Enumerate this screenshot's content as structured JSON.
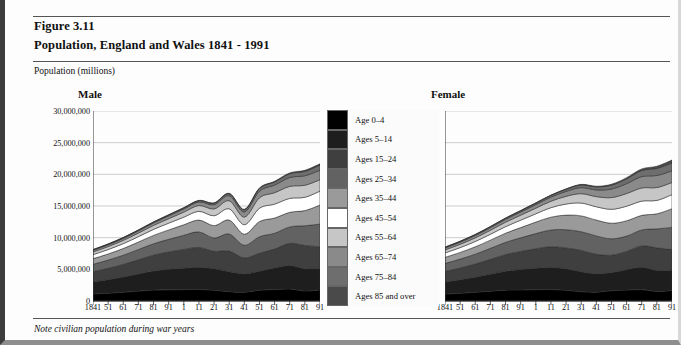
{
  "figure": {
    "number": "Figure 3.11",
    "title": "Population, England and Wales 1841 - 1991",
    "axis_unit": "Population (millions)",
    "note": "Note civilian population during war years"
  },
  "panels": [
    {
      "label": "Male"
    },
    {
      "label": "Female"
    }
  ],
  "legend": {
    "items": [
      {
        "label": "Age 0–4",
        "color": "#000000"
      },
      {
        "label": "Ages 5–14",
        "color": "#1e1e1e"
      },
      {
        "label": "Ages 15–24",
        "color": "#3f3f3f"
      },
      {
        "label": "Ages 25–34",
        "color": "#626262"
      },
      {
        "label": "Ages 35–44",
        "color": "#9a9a9a"
      },
      {
        "label": "Ages 45–54",
        "color": "#ffffff"
      },
      {
        "label": "Ages 55–64",
        "color": "#c6c6c6"
      },
      {
        "label": "Ages 65–74",
        "color": "#8a8a8a"
      },
      {
        "label": "Ages 75–84",
        "color": "#6e6e6e"
      },
      {
        "label": "Ages 85 and over",
        "color": "#4a4a4a"
      }
    ]
  },
  "chart_data": {
    "type": "area",
    "title": "Population, England and Wales 1841 - 1991",
    "subtitle": "Figure 3.11",
    "xlabel": "",
    "ylabel": "Population (millions)",
    "ylim": [
      0,
      30000000
    ],
    "yticks": [
      0,
      5000000,
      10000000,
      15000000,
      20000000,
      25000000,
      30000000
    ],
    "ytick_labels": [
      "0",
      "5,000,000",
      "10,000,000",
      "15,000,000",
      "20,000,000",
      "25,000,000",
      "30,000,000"
    ],
    "grid": true,
    "legend_position": "center",
    "annotation": "Note civilian population during war years",
    "x": [
      1841,
      1851,
      1861,
      1871,
      1881,
      1891,
      1901,
      1911,
      1921,
      1931,
      1941,
      1951,
      1961,
      1971,
      1981,
      1991
    ],
    "xtick_labels": [
      "1841",
      "51",
      "61",
      "71",
      "81",
      "91",
      "1",
      "11",
      "21",
      "31",
      "41",
      "51",
      "61",
      "71",
      "81",
      "91"
    ],
    "panels": [
      {
        "name": "Male",
        "series": [
          {
            "name": "Age 0–4",
            "values": [
              1100000,
              1230000,
              1380000,
              1560000,
              1720000,
              1760000,
              1790000,
              1810000,
              1700000,
              1480000,
              1400000,
              1700000,
              1800000,
              1900000,
              1580000,
              1750000
            ]
          },
          {
            "name": "Ages 5–14",
            "values": [
              1900000,
              2140000,
              2400000,
              2700000,
              3000000,
              3240000,
              3400000,
              3500000,
              3400000,
              3150000,
              2900000,
              3000000,
              3400000,
              3700000,
              3500000,
              3350000
            ]
          },
          {
            "name": "Ages 15–24",
            "values": [
              1620000,
              1800000,
              2000000,
              2250000,
              2520000,
              2740000,
              2960000,
              3150000,
              2750000,
              3250000,
              2500000,
              2850000,
              3000000,
              3500000,
              3700000,
              3450000
            ]
          },
          {
            "name": "Ages 25–34",
            "values": [
              1180000,
              1300000,
              1450000,
              1620000,
              1800000,
              2000000,
              2230000,
              2450000,
              2100000,
              2700000,
              2000000,
              2600000,
              2500000,
              2600000,
              3100000,
              3600000
            ]
          },
          {
            "name": "Ages 35–44",
            "values": [
              880000,
              960000,
              1060000,
              1180000,
              1320000,
              1480000,
              1660000,
              1870000,
              1950000,
              2200000,
              1750000,
              2400000,
              2400000,
              2300000,
              2400000,
              3000000
            ]
          },
          {
            "name": "Ages 45–54",
            "values": [
              640000,
              700000,
              770000,
              850000,
              950000,
              1070000,
              1200000,
              1380000,
              1560000,
              1780000,
              1500000,
              2100000,
              2200000,
              2200000,
              2100000,
              2200000
            ]
          },
          {
            "name": "Ages 55–64",
            "values": [
              430000,
              470000,
              520000,
              570000,
              630000,
              710000,
              800000,
              920000,
              1080000,
              1280000,
              1200000,
              1650000,
              1800000,
              1900000,
              1900000,
              1800000
            ]
          },
          {
            "name": "Ages 65–74",
            "values": [
              260000,
              285000,
              315000,
              345000,
              380000,
              430000,
              490000,
              560000,
              660000,
              800000,
              820000,
              1050000,
              1200000,
              1400000,
              1500000,
              1500000
            ]
          },
          {
            "name": "Ages 75–84",
            "values": [
              95000,
              105000,
              115000,
              128000,
              142000,
              160000,
              182000,
              210000,
              250000,
              310000,
              340000,
              420000,
              500000,
              600000,
              700000,
              800000
            ]
          },
          {
            "name": "Ages 85 and over",
            "values": [
              15000,
              17000,
              19000,
              21000,
              24000,
              27000,
              31000,
              36000,
              43000,
              54000,
              62000,
              80000,
              100000,
              130000,
              160000,
              210000
            ]
          }
        ]
      },
      {
        "name": "Female",
        "series": [
          {
            "name": "Age 0–4",
            "values": [
              1090000,
              1220000,
              1370000,
              1550000,
              1710000,
              1750000,
              1780000,
              1800000,
              1690000,
              1470000,
              1390000,
              1620000,
              1720000,
              1800000,
              1500000,
              1660000
            ]
          },
          {
            "name": "Ages 5–14",
            "values": [
              1890000,
              2130000,
              2390000,
              2690000,
              2990000,
              3230000,
              3390000,
              3490000,
              3390000,
              3140000,
              2890000,
              2870000,
              3230000,
              3520000,
              3330000,
              3180000
            ]
          },
          {
            "name": "Ages 15–24",
            "values": [
              1680000,
              1870000,
              2080000,
              2340000,
              2620000,
              2850000,
              3080000,
              3280000,
              3300000,
              3380000,
              3100000,
              2750000,
              2880000,
              3380000,
              3560000,
              3300000
            ]
          },
          {
            "name": "Ages 25–34",
            "values": [
              1270000,
              1400000,
              1560000,
              1740000,
              1940000,
              2150000,
              2400000,
              2640000,
              2880000,
              2950000,
              2900000,
              2580000,
              2420000,
              2520000,
              3000000,
              3480000
            ]
          },
          {
            "name": "Ages 35–44",
            "values": [
              960000,
              1050000,
              1160000,
              1290000,
              1440000,
              1610000,
              1810000,
              2030000,
              2300000,
              2500000,
              2500000,
              2460000,
              2420000,
              2300000,
              2380000,
              2950000
            ]
          },
          {
            "name": "Ages 45–54",
            "values": [
              700000,
              765000,
              840000,
              930000,
              1040000,
              1170000,
              1310000,
              1500000,
              1750000,
              2030000,
              2100000,
              2200000,
              2300000,
              2250000,
              2120000,
              2220000
            ]
          },
          {
            "name": "Ages 55–64",
            "values": [
              480000,
              525000,
              578000,
              635000,
              705000,
              790000,
              890000,
              1020000,
              1220000,
              1480000,
              1600000,
              1850000,
              2000000,
              2080000,
              2030000,
              1920000
            ]
          },
          {
            "name": "Ages 65–74",
            "values": [
              300000,
              330000,
              365000,
              400000,
              442000,
              498000,
              565000,
              650000,
              780000,
              960000,
              1060000,
              1350000,
              1560000,
              1800000,
              1900000,
              1850000
            ]
          },
          {
            "name": "Ages 75–84",
            "values": [
              120000,
              132000,
              146000,
              162000,
              180000,
              204000,
              232000,
              270000,
              330000,
              420000,
              480000,
              620000,
              760000,
              950000,
              1120000,
              1250000
            ]
          },
          {
            "name": "Ages 85 and over",
            "values": [
              22000,
              24000,
              27000,
              30000,
              34000,
              39000,
              45000,
              53000,
              66000,
              86000,
              102000,
              140000,
              190000,
              260000,
              340000,
              450000
            ]
          }
        ]
      }
    ]
  }
}
